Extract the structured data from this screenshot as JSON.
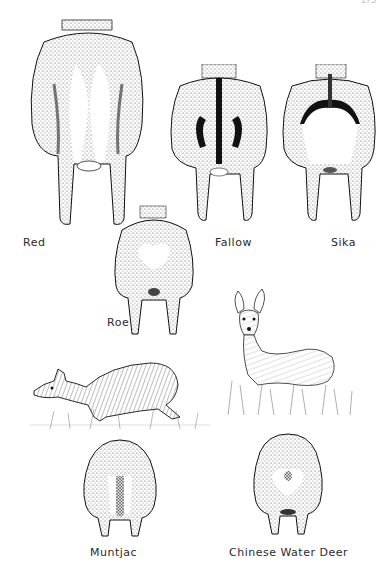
{
  "page": {
    "page_number": "173"
  },
  "figures": [
    {
      "id": "red",
      "label": "Red",
      "view": "rear"
    },
    {
      "id": "fallow",
      "label": "Fallow",
      "view": "rear"
    },
    {
      "id": "sika",
      "label": "Sika",
      "view": "rear"
    },
    {
      "id": "roe",
      "label": "Roe",
      "view": "rear"
    },
    {
      "id": "muntjac-side",
      "label": "",
      "view": "side"
    },
    {
      "id": "cwd-front",
      "label": "",
      "view": "front"
    },
    {
      "id": "muntjac",
      "label": "Muntjac",
      "view": "rear"
    },
    {
      "id": "chinese-water-deer",
      "label": "Chinese Water Deer",
      "view": "rear"
    }
  ],
  "colors": {
    "ink": "#1a1a1a",
    "stipple": "#9a9a9a",
    "patch": "#ffffff"
  }
}
